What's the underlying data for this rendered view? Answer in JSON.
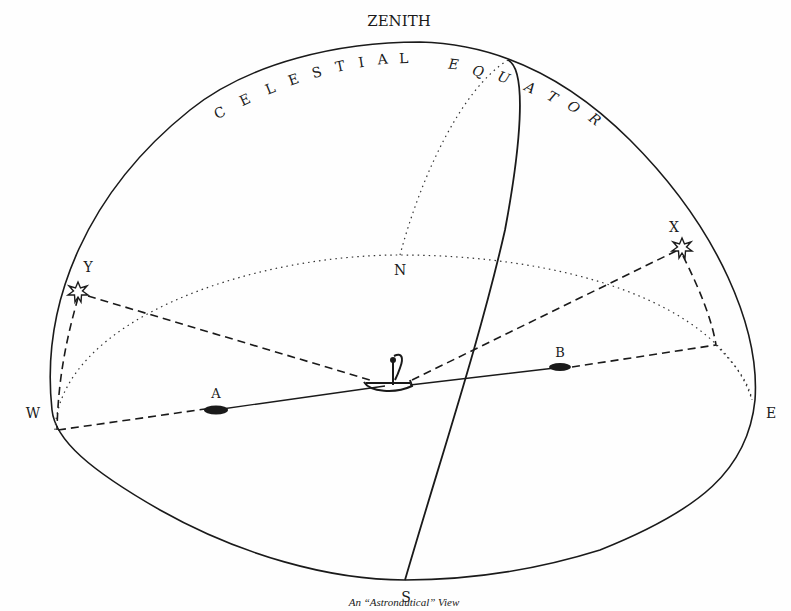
{
  "diagram": {
    "title": "An “Astronautical” View",
    "labels": {
      "zenith": "ZENITH",
      "north": "N",
      "south": "S",
      "east": "E",
      "west": "W",
      "star_x": "X",
      "star_y": "Y",
      "island_a": "A",
      "island_b": "B"
    },
    "arc_text": {
      "celestial": [
        "C",
        "E",
        "L",
        "E",
        "S",
        "T",
        "I",
        "A",
        "L"
      ],
      "equator": [
        "E",
        "Q",
        "U",
        "A",
        "T",
        "O",
        "R"
      ]
    },
    "elements": {
      "dome": "celestial-hemisphere-outline",
      "horizon": "dotted-horizon-ellipse",
      "equator_arc": "solid-celestial-equator-line",
      "meridian": "dotted-meridian-arc",
      "ship": "canoe-observer-icon",
      "stars": [
        "star-x",
        "star-y"
      ],
      "islands": [
        "island-a",
        "island-b"
      ]
    },
    "colors": {
      "ink": "#1a1a1a",
      "paper": "#fefefe"
    }
  }
}
